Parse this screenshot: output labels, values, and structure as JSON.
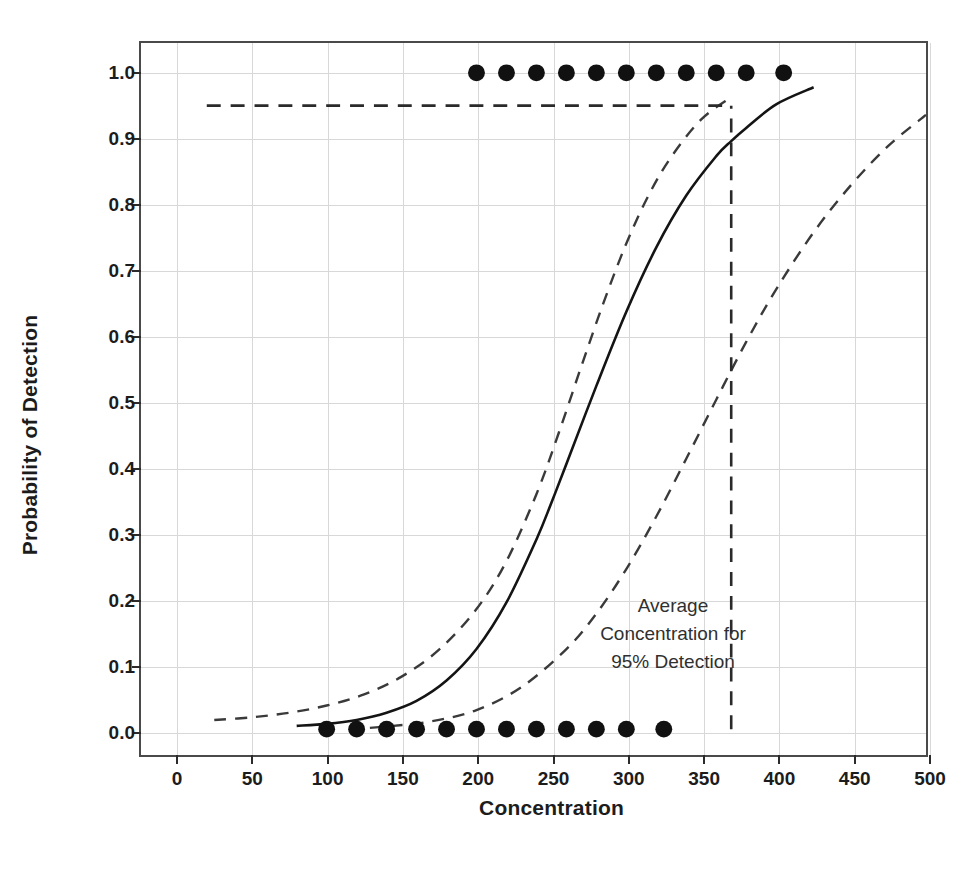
{
  "chart_data": {
    "type": "line",
    "title": "",
    "xlabel": "Concentration",
    "ylabel": "Probability of Detection",
    "xlim": [
      0,
      500
    ],
    "ylim": [
      0.0,
      1.0
    ],
    "grid": true,
    "legend_position": "none",
    "xticks": [
      0,
      50,
      100,
      150,
      200,
      250,
      300,
      350,
      400,
      450,
      500
    ],
    "xtick_labels": [
      "0",
      "50",
      "100",
      "150",
      "200",
      "250",
      "300",
      "350",
      "400",
      "450",
      "500"
    ],
    "yticks": [
      0.0,
      0.1,
      0.2,
      0.3,
      0.4,
      0.5,
      0.6,
      0.7,
      0.8,
      0.9,
      1.0
    ],
    "ytick_labels": [
      "0.0",
      "0.1",
      "0.2",
      "0.3",
      "0.4",
      "0.5",
      "0.6",
      "0.7",
      "0.8",
      "0.9",
      "1.0"
    ],
    "series": [
      {
        "name": "Fitted probability of detection",
        "style": "solid",
        "x": [
          80,
          100,
          120,
          140,
          160,
          180,
          200,
          220,
          240,
          250,
          260,
          280,
          300,
          320,
          340,
          360,
          370,
          380,
          400,
          425
        ],
        "values": [
          0.005,
          0.008,
          0.014,
          0.025,
          0.043,
          0.074,
          0.122,
          0.193,
          0.289,
          0.345,
          0.404,
          0.523,
          0.636,
          0.734,
          0.813,
          0.873,
          0.896,
          0.916,
          0.952,
          0.978
        ]
      },
      {
        "name": "Upper confidence limit",
        "style": "dashed",
        "x": [
          25,
          50,
          75,
          100,
          125,
          150,
          175,
          200,
          220,
          240,
          255,
          270,
          285,
          300,
          315,
          330,
          350,
          370
        ],
        "values": [
          0.014,
          0.018,
          0.025,
          0.036,
          0.053,
          0.08,
          0.121,
          0.183,
          0.256,
          0.358,
          0.452,
          0.553,
          0.651,
          0.74,
          0.814,
          0.872,
          0.929,
          0.963
        ]
      },
      {
        "name": "Lower confidence limit",
        "style": "dashed",
        "x": [
          115,
          140,
          170,
          200,
          230,
          260,
          280,
          300,
          320,
          340,
          360,
          380,
          400,
          425,
          450,
          475,
          500
        ],
        "values": [
          0.0,
          0.004,
          0.012,
          0.029,
          0.064,
          0.122,
          0.176,
          0.244,
          0.324,
          0.412,
          0.502,
          0.59,
          0.67,
          0.757,
          0.829,
          0.889,
          0.936
        ]
      }
    ],
    "observations": [
      {
        "name": "Detected observations",
        "probability": 1.0,
        "x": [
          200,
          220,
          240,
          260,
          280,
          300,
          320,
          340,
          360,
          380,
          405
        ],
        "marker": "filled-circle"
      },
      {
        "name": "Non-detected observations",
        "probability": 0.0,
        "x": [
          100,
          120,
          140,
          160,
          180,
          200,
          220,
          240,
          260,
          280,
          300,
          325
        ],
        "marker": "filled-circle"
      }
    ],
    "reference_lines": [
      {
        "name": "95-percent-detection-horizontal",
        "orientation": "horizontal",
        "y": 0.95,
        "x_start": 20,
        "x_end": 370,
        "style": "dashed"
      },
      {
        "name": "average-concentration-vertical",
        "orientation": "vertical",
        "x": 370,
        "y_start": 0.0,
        "y_end": 0.95,
        "style": "dashed"
      }
    ],
    "annotations": [
      {
        "name": "average-concentration-callout",
        "lines": [
          "Average",
          "Concentration for",
          "95% Detection"
        ],
        "x": 430,
        "y": 0.19
      }
    ],
    "colors": {
      "curve": "#141414",
      "confidence": "#3a3a3a",
      "reference": "#2a2a2a",
      "grid": "#d8d8d8",
      "axis": "#4a4a4a",
      "text": "#1c1c1c"
    }
  }
}
